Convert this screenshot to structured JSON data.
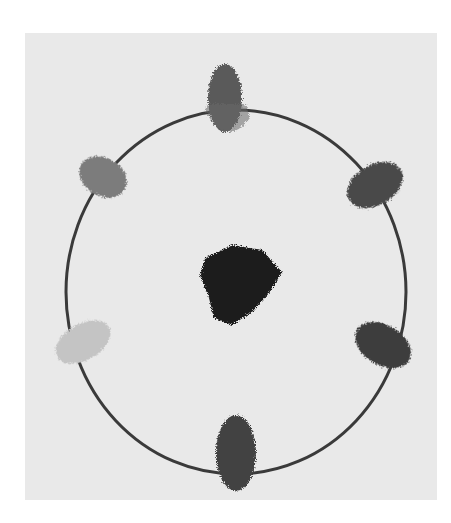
{
  "image": {
    "subject": "Photograph of a paint-daub color circle on paper (grayscale)",
    "background_color": "#ffffff",
    "paper_color": "#e9e9e9",
    "ring": {
      "cx": 236,
      "cy": 292,
      "rx": 170,
      "ry": 182,
      "stroke": "#3a3a3a",
      "stroke_width": 3
    },
    "center_blob": {
      "color": "#1e1e1e",
      "label": "center dark mixture"
    },
    "daubs": [
      {
        "position": "top",
        "cx": 225,
        "cy": 98,
        "rx": 17,
        "ry": 34,
        "rotate": 0,
        "color": "#5a5a5a"
      },
      {
        "position": "upper-right",
        "cx": 375,
        "cy": 185,
        "rx": 30,
        "ry": 20,
        "rotate": -30,
        "color": "#4a4a4a"
      },
      {
        "position": "lower-right",
        "cx": 383,
        "cy": 345,
        "rx": 30,
        "ry": 20,
        "rotate": 30,
        "color": "#3e3e3e"
      },
      {
        "position": "bottom",
        "cx": 236,
        "cy": 453,
        "rx": 20,
        "ry": 38,
        "rotate": 0,
        "color": "#434343"
      },
      {
        "position": "lower-left",
        "cx": 83,
        "cy": 342,
        "rx": 30,
        "ry": 18,
        "rotate": -30,
        "color": "#c4c4c4"
      },
      {
        "position": "upper-left",
        "cx": 103,
        "cy": 177,
        "rx": 25,
        "ry": 19,
        "rotate": 30,
        "color": "#7c7c7c"
      }
    ]
  }
}
